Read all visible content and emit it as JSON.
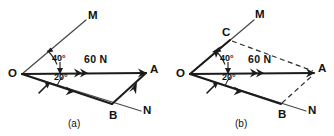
{
  "figure": {
    "background_color": "#ffffff",
    "line_color": "#1b1b1b",
    "dashed_color": "#2b2b2b",
    "panels": [
      {
        "caption": "(a)",
        "origin_label": "O",
        "force_label": "60 N",
        "angle_upper": "40°",
        "angle_lower": "20°",
        "ray_upper_label": "M",
        "ray_lower_label": "N",
        "point_a": "A",
        "point_b": "B"
      },
      {
        "caption": "(b)",
        "origin_label": "O",
        "force_label": "60 N",
        "angle_upper": "40°",
        "angle_lower": "20°",
        "ray_upper_label": "M",
        "ray_lower_label": "N",
        "point_a": "A",
        "point_b": "B",
        "point_c": "C"
      }
    ]
  }
}
